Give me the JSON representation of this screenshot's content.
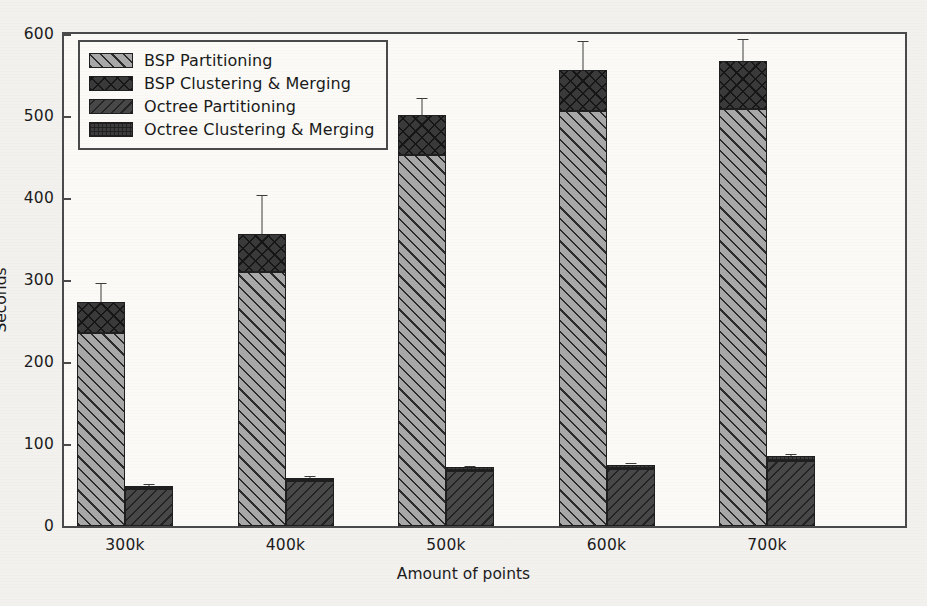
{
  "chart_data": {
    "type": "bar",
    "title": "",
    "xlabel": "Amount of points",
    "ylabel": "Seconds",
    "categories": [
      "300k",
      "400k",
      "500k",
      "600k",
      "700k"
    ],
    "ylim": [
      0,
      600
    ],
    "yticks": [
      0,
      100,
      200,
      300,
      400,
      500,
      600
    ],
    "grid": false,
    "legend_position": "upper left",
    "stacked": true,
    "groups": [
      "BSP",
      "Octree"
    ],
    "series": [
      {
        "name": "BSP Partitioning",
        "group": "BSP",
        "stack_order": 0,
        "values": [
          235,
          310,
          452,
          506,
          509
        ]
      },
      {
        "name": "BSP Clustering & Merging",
        "group": "BSP",
        "stack_order": 1,
        "values": [
          38,
          46,
          49,
          50,
          58
        ]
      },
      {
        "name": "Octree Partitioning",
        "group": "Octree",
        "stack_order": 0,
        "values": [
          45,
          55,
          67,
          70,
          79
        ]
      },
      {
        "name": "Octree Clustering & Merging",
        "group": "Octree",
        "stack_order": 1,
        "values": [
          4,
          4,
          5,
          5,
          6
        ]
      }
    ],
    "totals": {
      "bsp": [
        273,
        356,
        501,
        556,
        567
      ],
      "octree": [
        49,
        59,
        72,
        75,
        85
      ]
    },
    "error_bars": {
      "bsp_total_upper": [
        296,
        404,
        522,
        592,
        594
      ],
      "octree_total_upper": [
        51,
        61,
        73,
        77,
        88
      ]
    },
    "colors": {
      "bsp_partitioning": "#a8a8a8",
      "bsp_clustering": "#3a3a3a",
      "octree_partitioning": "#484848",
      "octree_clustering": "#3d3d3d",
      "axis": "#4a4a4a",
      "background": "#fbfaf7"
    }
  },
  "legend": {
    "items": [
      {
        "label": "BSP Partitioning",
        "swatch": "pat-bsp-part"
      },
      {
        "label": "BSP Clustering & Merging",
        "swatch": "pat-bsp-clus"
      },
      {
        "label": "Octree Partitioning",
        "swatch": "pat-oct-part"
      },
      {
        "label": "Octree Clustering & Merging",
        "swatch": "pat-oct-clus"
      }
    ]
  },
  "axes": {
    "y_label": "Seconds",
    "x_label": "Amount of points",
    "y_tick_labels": [
      "0",
      "100",
      "200",
      "300",
      "400",
      "500",
      "600"
    ],
    "x_tick_labels": [
      "300k",
      "400k",
      "500k",
      "600k",
      "700k"
    ]
  }
}
